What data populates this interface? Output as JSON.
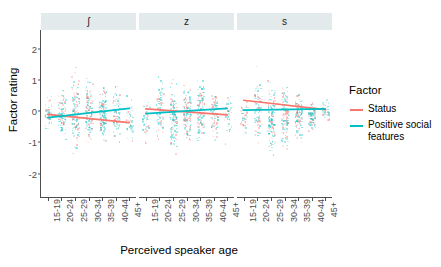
{
  "chart_data": {
    "type": "scatter",
    "title": "",
    "xlabel": "Perceived speaker age",
    "ylabel": "Factor rating",
    "ylim": [
      -2.75,
      2.6
    ],
    "yticks": [
      2,
      1,
      0,
      -1,
      -2
    ],
    "ytick_labels": [
      "2",
      "1",
      "0",
      "-1",
      "-2"
    ],
    "categories": [
      "15-19",
      "20-24",
      "25-29",
      "30-34",
      "35-39",
      "40-44",
      "45+"
    ],
    "grid": false,
    "legend_position": "right",
    "legend_title": "Factor",
    "series": [
      {
        "name": "Status",
        "color": "#F8766D"
      },
      {
        "name": "Positive social features",
        "color": "#00BFC4"
      }
    ],
    "facet_variable": "Sibilant",
    "facets": [
      {
        "label": "ʃ",
        "trend_lines": [
          {
            "series": "Status",
            "x_start": "15-19",
            "y_start": -0.1,
            "x_end": "45+",
            "y_end": -0.37
          },
          {
            "series": "Positive social features",
            "x_start": "15-19",
            "y_start": -0.21,
            "x_end": "45+",
            "y_end": 0.09
          }
        ]
      },
      {
        "label": "z",
        "trend_lines": [
          {
            "series": "Status",
            "x_start": "15-19",
            "y_start": 0.07,
            "x_end": "45+",
            "y_end": -0.12
          },
          {
            "series": "Positive social features",
            "x_start": "15-19",
            "y_start": -0.08,
            "x_end": "45+",
            "y_end": 0.09
          }
        ]
      },
      {
        "label": "s",
        "trend_lines": [
          {
            "series": "Status",
            "x_start": "15-19",
            "y_start": 0.35,
            "x_end": "45+",
            "y_end": 0.05
          },
          {
            "series": "Positive social features",
            "x_start": "15-19",
            "y_start": 0.03,
            "x_end": "45+",
            "y_end": 0.07
          }
        ]
      }
    ],
    "point_spread": {
      "description": "Jittered individual factor ratings per age bin, both factors overplotted",
      "facet_bin_ranges": [
        [
          [
            -1.1,
            1.1
          ],
          [
            -1.7,
            1.6
          ],
          [
            -2.3,
            2.4
          ],
          [
            -2.0,
            1.9
          ],
          [
            -1.9,
            1.7
          ],
          [
            -1.8,
            1.6
          ],
          [
            -1.8,
            1.2
          ]
        ],
        [
          [
            -1.6,
            1.2
          ],
          [
            -1.9,
            2.1
          ],
          [
            -2.3,
            1.9
          ],
          [
            -2.0,
            1.8
          ],
          [
            -1.9,
            1.9
          ],
          [
            -1.8,
            1.6
          ],
          [
            -1.5,
            1.3
          ]
        ],
        [
          [
            -1.5,
            1.2
          ],
          [
            -2.1,
            2.4
          ],
          [
            -2.4,
            1.9
          ],
          [
            -2.2,
            1.9
          ],
          [
            -1.7,
            1.4
          ],
          [
            -1.2,
            0.9
          ],
          [
            -0.7,
            0.7
          ]
        ]
      ]
    }
  },
  "legend": {
    "title": "Factor",
    "items": [
      {
        "label": "Status",
        "color": "#F8766D"
      },
      {
        "label": "Positive social features",
        "color": "#00BFC4"
      }
    ]
  },
  "axes": {
    "y_title": "Factor rating",
    "x_title": "Perceived speaker age"
  }
}
